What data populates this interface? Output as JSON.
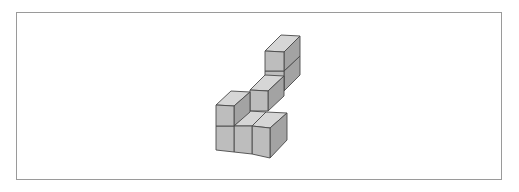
{
  "figure": {
    "type": "isometric cube structure",
    "cube_count_visible": 7,
    "colors": {
      "border": "#9a9a9a",
      "top_face": "#d6d6d6",
      "front_face": "#bdbdbd",
      "side_face": "#a3a3a3",
      "edge": "#4a4a4a"
    }
  }
}
